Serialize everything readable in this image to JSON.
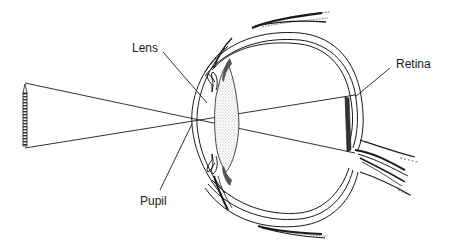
{
  "diagram": {
    "labels": {
      "lens": "Lens",
      "pupil": "Pupil",
      "retina": "Retina"
    },
    "colors": {
      "ink": "#1a1a1a",
      "background": "#ffffff",
      "lens_stipple": "#c8c8c8"
    }
  }
}
